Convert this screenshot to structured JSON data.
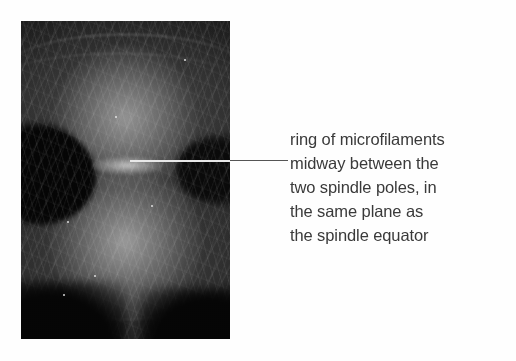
{
  "figure": {
    "background_color": "#fefefe",
    "micrograph": {
      "alt_name": "fluorescence-micrograph-dividing-cell",
      "description": "Dark-field fluorescence micrograph of a dividing cell in cytokinesis showing two spindle-pole lobes separated by a constricted waist",
      "background_color": "#000000",
      "specks": [
        {
          "left": "22%",
          "top": "63%"
        },
        {
          "left": "62%",
          "top": "58%"
        },
        {
          "left": "45%",
          "top": "30%"
        },
        {
          "left": "78%",
          "top": "12%"
        },
        {
          "left": "35%",
          "top": "80%"
        },
        {
          "left": "20%",
          "top": "86%"
        }
      ]
    },
    "leader_line": {
      "name": "leader-line",
      "color_inside_image": "#e8e8e8",
      "color_outside_image": "#555555"
    },
    "caption": {
      "color": "#3a3a3a",
      "lines": [
        "ring of microfilaments",
        "midway between the",
        "two spindle poles, in",
        "the same plane as",
        "the spindle equator"
      ]
    }
  }
}
